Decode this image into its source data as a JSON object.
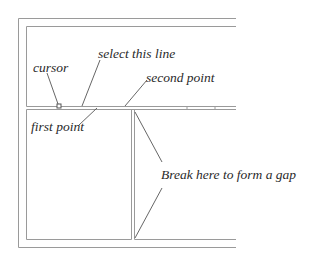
{
  "diagram": {
    "title": "",
    "labels": {
      "cursor": "cursor",
      "select_line": "select this line",
      "second_point": "second point",
      "first_point": "first point",
      "break_gap": "Break here to form a gap"
    },
    "colors": {
      "wall": "#9a9a9a",
      "leader": "#555555",
      "text": "#2a2a2a"
    }
  }
}
